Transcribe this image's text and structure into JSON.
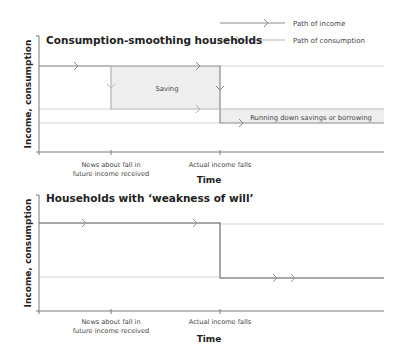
{
  "legend": {
    "income_label": "Path of income",
    "consumption_label": "Path of consumption"
  },
  "colors": {
    "income": "#8a8a8a",
    "consumption": "#b4b4b4",
    "axis": "#7a7a7a",
    "fill": "#eeeeee",
    "text": "#333333"
  },
  "top_chart": {
    "title": "Consumption-smoothing households",
    "ylabel": "Income, consumption",
    "xlabel": "Time",
    "tick1_line1": "News about fall in",
    "tick1_line2": "future income received",
    "tick2": "Actual income falls",
    "saving_label": "Saving",
    "borrowing_label": "Running down savings or borrowing"
  },
  "bottom_chart": {
    "title": "Households with ‘weakness of will’",
    "ylabel": "Income, consumption",
    "xlabel": "Time",
    "tick1_line1": "News about fall in",
    "tick1_line2": "future income received",
    "tick2": "Actual income falls"
  }
}
